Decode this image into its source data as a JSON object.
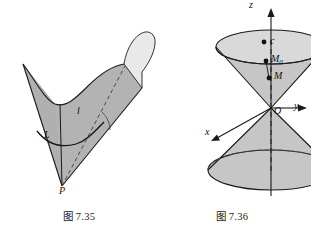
{
  "page": {
    "background": "#ffffff",
    "width": 311,
    "height": 233
  },
  "palette": {
    "surface_gray": "#b3b3b3",
    "surface_light": "#e9e9e9",
    "cone_gray": "#c6c6c6",
    "cone_top_gray": "#d9d9d9",
    "outline": "#1a1a1a",
    "dashed": "#3a3a3a",
    "text": "#1a1a1a"
  },
  "figures": [
    {
      "id": "fig-735",
      "caption": "图 7.35",
      "kind": "ruled-surface-cone-over-curve",
      "description": "A cone-like ruled surface generated by lines through apex P and a space curve l, with a second curve L drawn on the surface.",
      "labels": [
        {
          "name": "curve-l",
          "text": "l",
          "x": 77,
          "y": 113
        },
        {
          "name": "curve-L",
          "text": "L",
          "x": 44,
          "y": 136
        },
        {
          "name": "apex-P",
          "text": "P",
          "x": 59,
          "y": 186
        }
      ]
    },
    {
      "id": "fig-736",
      "caption": "图 7.36",
      "kind": "double-cone-with-axes",
      "description": "A double circular cone with vertex at origin O, symmetry axis along z, coordinate axes x, y, z, marked points c, M0 and M on the upper nappe.",
      "axes": [
        {
          "name": "z-axis",
          "label": "z",
          "x": 248,
          "y": 3
        },
        {
          "name": "y-axis",
          "label": "y",
          "x": 293,
          "y": 104
        },
        {
          "name": "x-axis",
          "label": "x",
          "x": 205,
          "y": 141
        },
        {
          "name": "origin",
          "label": "O",
          "x": 271,
          "y": 107
        }
      ],
      "points": [
        {
          "name": "point-c",
          "text": "c",
          "sub": "",
          "x": 254,
          "y": 40,
          "dot_x": 246,
          "dot_y": 42
        },
        {
          "name": "point-M0",
          "text": "M",
          "sub": "0",
          "x": 252,
          "y": 56,
          "dot_x": 246,
          "dot_y": 61
        },
        {
          "name": "point-M",
          "text": "M",
          "sub": "",
          "x": 256,
          "y": 73,
          "dot_x": 249,
          "dot_y": 78
        }
      ]
    }
  ]
}
